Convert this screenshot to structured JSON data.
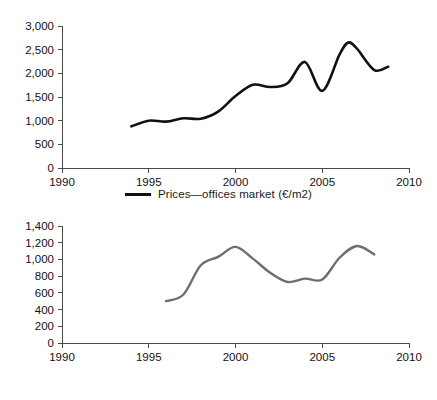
{
  "figure": {
    "background_color": "#ffffff",
    "panels": [
      {
        "id": "prices",
        "legend_label": "Prices—offices market (€/m2)",
        "legend_color": "#111111"
      },
      {
        "id": "transactions",
        "legend_label": "Amount of transactions—offices market",
        "legend_color": "#6e6e6e"
      }
    ]
  },
  "chart_data": [
    {
      "type": "line",
      "title": "",
      "xlabel": "",
      "ylabel": "",
      "xlim": [
        1990,
        2010
      ],
      "ylim": [
        0,
        3000
      ],
      "xticks": [
        1990,
        1995,
        2000,
        2005,
        2010
      ],
      "xticklabels": [
        "1990",
        "1995",
        "2000",
        "2005",
        "2010"
      ],
      "yticks": [
        0,
        500,
        1000,
        1500,
        2000,
        2500,
        3000
      ],
      "yticklabels": [
        "0",
        "500",
        "1,000",
        "1,500",
        "2,000",
        "2,500",
        "3,000"
      ],
      "grid": false,
      "legend_position": "below-center",
      "series": [
        {
          "name": "Prices—offices market (€/m2)",
          "color": "#111111",
          "x": [
            1994,
            1995,
            1996,
            1997,
            1998,
            1999,
            2000,
            2001,
            2002,
            2003,
            2004,
            2005,
            2006,
            2006.5,
            2007,
            2008,
            2008.8
          ],
          "values": [
            880,
            1000,
            980,
            1050,
            1040,
            1190,
            1520,
            1760,
            1710,
            1790,
            2240,
            1630,
            2400,
            2650,
            2520,
            2070,
            2140
          ]
        }
      ]
    },
    {
      "type": "line",
      "title": "",
      "xlabel": "",
      "ylabel": "",
      "xlim": [
        1990,
        2010
      ],
      "ylim": [
        0,
        1400
      ],
      "xticks": [
        1990,
        1995,
        2000,
        2005,
        2010
      ],
      "xticklabels": [
        "1990",
        "1995",
        "2000",
        "2005",
        "2010"
      ],
      "yticks": [
        0,
        200,
        400,
        600,
        800,
        1000,
        1200,
        1400
      ],
      "yticklabels": [
        "0",
        "200",
        "400",
        "600",
        "800",
        "1,000",
        "1,200",
        "1,400"
      ],
      "grid": false,
      "legend_position": "below-center",
      "series": [
        {
          "name": "Amount of transactions—offices market",
          "color": "#6e6e6e",
          "x": [
            1996,
            1997,
            1998,
            1999,
            2000,
            2001,
            2002,
            2003,
            2004,
            2005,
            2006,
            2007,
            2008
          ],
          "values": [
            500,
            580,
            930,
            1030,
            1150,
            1010,
            840,
            730,
            770,
            760,
            1020,
            1160,
            1060
          ]
        }
      ]
    }
  ]
}
